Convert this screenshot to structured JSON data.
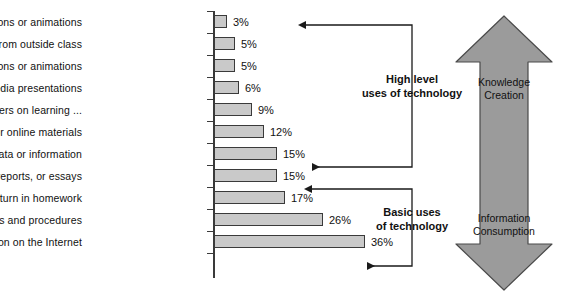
{
  "chart_data": {
    "type": "bar",
    "orientation": "horizontal",
    "title": "",
    "xlabel": "",
    "ylabel": "",
    "xlim": [
      0,
      36
    ],
    "grid": false,
    "legend": null,
    "value_suffix": "%",
    "categories": [
      "Develop simulations or animations",
      "Work with others from outside class",
      "Use simulations or animations",
      "Create multimedia presentations",
      "Collaborate with peers on learning ...",
      "Access class resources or online materials",
      "Analyse data or information",
      "Write or edit stories, reports, or essays",
      "Take tests or turn in homework",
      "Practise routine skills and procedures",
      "Find information on the Internet"
    ],
    "values": [
      3,
      5,
      5,
      6,
      9,
      12,
      15,
      15,
      17,
      26,
      36
    ],
    "value_labels": [
      "3%",
      "5%",
      "5%",
      "6%",
      "9%",
      "12%",
      "15%",
      "15%",
      "17%",
      "26%",
      "36%"
    ],
    "bar_fill_color": "#c9c9c9",
    "bar_border_color": "#3a3a3a"
  },
  "annotations": {
    "high_level": {
      "line1": "High level",
      "line2": "uses of technology",
      "spans_from_category_index": 0,
      "spans_to_category_index": 6
    },
    "basic_uses": {
      "line1": "Basic uses",
      "line2": "of technology",
      "spans_from_category_index": 7,
      "spans_to_category_index": 10
    }
  },
  "axis_arrow": {
    "top_label_line1": "Knowledge",
    "top_label_line2": "Creation",
    "bottom_label_line1": "Information",
    "bottom_label_line2": "Consumption",
    "fill_color": "#9b9b9b",
    "border_color": "#4a4a4a"
  }
}
